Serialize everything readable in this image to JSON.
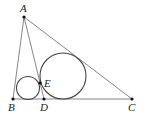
{
  "diagram": {
    "points": {
      "A": {
        "label": "A",
        "x": 24,
        "y": 17
      },
      "B": {
        "label": "B",
        "x": 13,
        "y": 99
      },
      "C": {
        "label": "C",
        "x": 132,
        "y": 99
      },
      "D": {
        "label": "D",
        "x": 44,
        "y": 99
      },
      "E": {
        "label": "E",
        "x": 40,
        "y": 83
      }
    },
    "segments": [
      "AB",
      "AC",
      "BC",
      "AD"
    ],
    "circles": [
      {
        "name": "incircle-ABD",
        "cx": 28,
        "cy": 88,
        "r": 11.5
      },
      {
        "name": "incircle-ADC",
        "cx": 63,
        "cy": 76,
        "r": 23
      }
    ],
    "colors": {
      "line": "#555555",
      "point": "#111111"
    }
  }
}
